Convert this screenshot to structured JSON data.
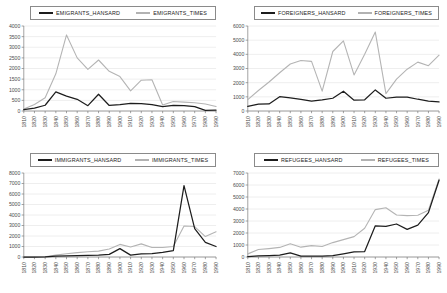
{
  "figure": {
    "type": "multi-panel-line-chart",
    "panels": 4,
    "layout": "2x2",
    "shared_xlabels": [
      "1810",
      "1820",
      "1830",
      "1840",
      "1850",
      "1860",
      "1870",
      "1880",
      "1890",
      "1900",
      "1910",
      "1920",
      "1930",
      "1940",
      "1950",
      "1960",
      "1970",
      "1980",
      "1990"
    ],
    "colors": {
      "hansard": "#1d1d1d",
      "times": "#b4b4b4",
      "grid": "#e2e2e2",
      "axis": "#7a7a7a"
    }
  },
  "chart_data": [
    {
      "id": "emigrants",
      "type": "line",
      "title": "",
      "xlabel": "",
      "ylabel": "",
      "x": [
        "1810",
        "1820",
        "1830",
        "1840",
        "1850",
        "1860",
        "1870",
        "1880",
        "1890",
        "1900",
        "1910",
        "1920",
        "1930",
        "1940",
        "1950",
        "1960",
        "1970",
        "1980",
        "1990"
      ],
      "ylim": [
        0,
        4000
      ],
      "yticks": [
        0,
        500,
        1000,
        1500,
        2000,
        2500,
        3000,
        3500,
        4000
      ],
      "grid": true,
      "legend_position": "top",
      "series": [
        {
          "name": "EMIGRANTS_HANSARD",
          "color": "#1d1d1d",
          "values": [
            60,
            140,
            270,
            900,
            700,
            550,
            250,
            790,
            260,
            300,
            360,
            350,
            300,
            210,
            260,
            250,
            210,
            30,
            40
          ]
        },
        {
          "name": "EMIGRANTS_TIMES",
          "color": "#b4b4b4",
          "values": [
            90,
            310,
            620,
            1750,
            3580,
            2500,
            1960,
            2400,
            1870,
            1620,
            950,
            1450,
            1470,
            280,
            450,
            420,
            390,
            330,
            210
          ]
        }
      ]
    },
    {
      "id": "foreigners",
      "type": "line",
      "title": "",
      "xlabel": "",
      "ylabel": "",
      "x": [
        "1810",
        "1820",
        "1830",
        "1840",
        "1850",
        "1860",
        "1870",
        "1880",
        "1890",
        "1900",
        "1910",
        "1920",
        "1930",
        "1940",
        "1950",
        "1960",
        "1970",
        "1980",
        "1990"
      ],
      "ylim": [
        0,
        6000
      ],
      "yticks": [
        0,
        1000,
        2000,
        3000,
        4000,
        5000,
        6000
      ],
      "grid": true,
      "legend_position": "top",
      "series": [
        {
          "name": "FOREIGNERS_HANSARD",
          "color": "#1d1d1d",
          "values": [
            330,
            480,
            500,
            1010,
            930,
            820,
            700,
            780,
            900,
            1400,
            760,
            790,
            1490,
            900,
            980,
            980,
            830,
            700,
            640
          ]
        },
        {
          "name": "FOREIGNERS_TIMES",
          "color": "#b4b4b4",
          "values": [
            800,
            1450,
            2050,
            2700,
            3320,
            3570,
            3500,
            1400,
            4200,
            4950,
            2550,
            4000,
            5570,
            1230,
            2250,
            2950,
            3450,
            3200,
            3950
          ]
        }
      ]
    },
    {
      "id": "immigrants",
      "type": "line",
      "title": "",
      "xlabel": "",
      "ylabel": "",
      "x": [
        "1810",
        "1820",
        "1830",
        "1840",
        "1850",
        "1860",
        "1870",
        "1880",
        "1890",
        "1900",
        "1910",
        "1920",
        "1930",
        "1940",
        "1950",
        "1960",
        "1970",
        "1980",
        "1990"
      ],
      "ylim": [
        0,
        8000
      ],
      "yticks": [
        0,
        1000,
        2000,
        3000,
        4000,
        5000,
        6000,
        7000,
        8000
      ],
      "grid": true,
      "legend_position": "top",
      "series": [
        {
          "name": "IMMIGRANTS_HANSARD",
          "color": "#1d1d1d",
          "values": [
            0,
            0,
            20,
            90,
            110,
            130,
            150,
            170,
            250,
            800,
            180,
            300,
            330,
            450,
            600,
            6800,
            2700,
            1400,
            1000
          ]
        },
        {
          "name": "IMMIGRANTS_TIMES",
          "color": "#b4b4b4",
          "values": [
            0,
            0,
            30,
            180,
            310,
            420,
            500,
            560,
            760,
            1200,
            950,
            1250,
            900,
            900,
            1000,
            2950,
            2900,
            1950,
            2400
          ]
        }
      ]
    },
    {
      "id": "refugees",
      "type": "line",
      "title": "",
      "xlabel": "",
      "ylabel": "",
      "x": [
        "1810",
        "1820",
        "1830",
        "1840",
        "1850",
        "1860",
        "1870",
        "1880",
        "1890",
        "1900",
        "1910",
        "1920",
        "1930",
        "1940",
        "1950",
        "1960",
        "1970",
        "1980",
        "1990"
      ],
      "ylim": [
        0,
        7000
      ],
      "yticks": [
        0,
        1000,
        2000,
        3000,
        4000,
        5000,
        6000,
        7000
      ],
      "grid": true,
      "legend_position": "top",
      "series": [
        {
          "name": "REFUGEES_HANSARD",
          "color": "#1d1d1d",
          "values": [
            30,
            100,
            120,
            150,
            350,
            80,
            70,
            70,
            110,
            260,
            430,
            450,
            2600,
            2550,
            2750,
            2300,
            2650,
            3700,
            6400
          ]
        },
        {
          "name": "REFUGEES_TIMES",
          "color": "#b4b4b4",
          "values": [
            260,
            620,
            700,
            800,
            1100,
            820,
            950,
            880,
            1200,
            1450,
            1700,
            2400,
            3950,
            4100,
            3500,
            3450,
            3480,
            3900,
            6500
          ]
        }
      ]
    }
  ],
  "panels": [
    {
      "name": "emigrants-panel",
      "legend": [
        {
          "label": "EMIGRANTS_HANSARD",
          "style": "hansard"
        },
        {
          "label": "EMIGRANTS_TIMES",
          "style": "times"
        }
      ]
    },
    {
      "name": "foreigners-panel",
      "legend": [
        {
          "label": "FOREIGNERS_HANSARD",
          "style": "hansard"
        },
        {
          "label": "FOREIGNERS_TIMES",
          "style": "times"
        }
      ]
    },
    {
      "name": "immigrants-panel",
      "legend": [
        {
          "label": "IMMIGRANTS_HANSARD",
          "style": "hansard"
        },
        {
          "label": "IMMIGRANTS_TIMES",
          "style": "times"
        }
      ]
    },
    {
      "name": "refugees-panel",
      "legend": [
        {
          "label": "REFUGEES_HANSARD",
          "style": "hansard"
        },
        {
          "label": "REFUGEES_TIMES",
          "style": "times"
        }
      ]
    }
  ]
}
